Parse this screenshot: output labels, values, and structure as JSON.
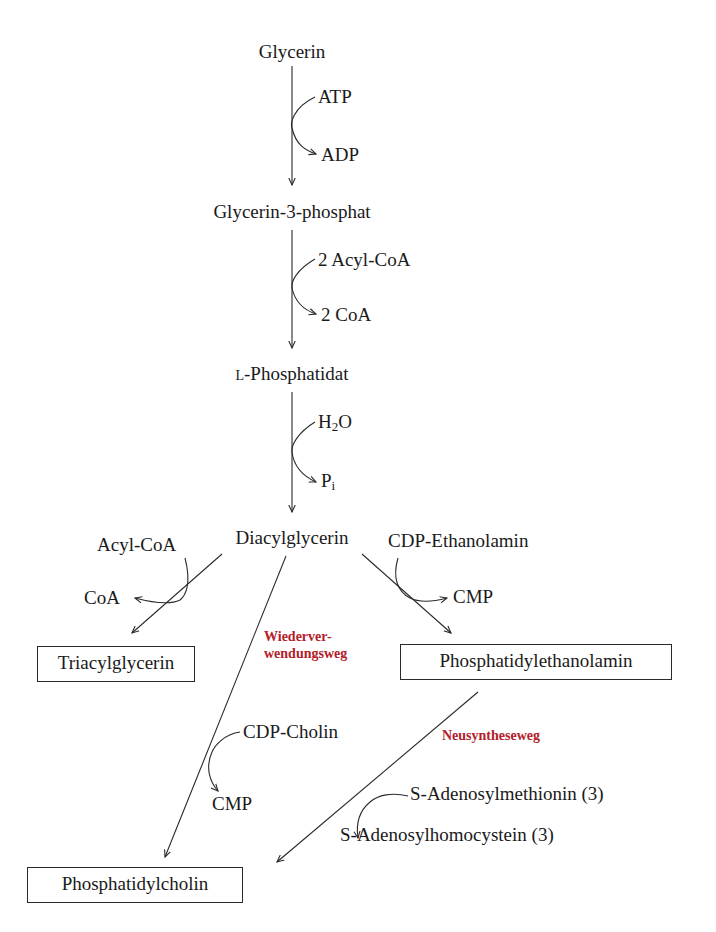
{
  "diagram": {
    "nodes": {
      "glycerin": "Glycerin",
      "glycerin3p": "Glycerin-3-phosphat",
      "phosphatidat_prefix": "L",
      "phosphatidat": "-Phosphatidat",
      "diacylglycerin": "Diacylglycerin",
      "triacylglycerin": "Triacylglycerin",
      "phosphatidylethanolamin": "Phosphatidylethanolamin",
      "phosphatidylcholin": "Phosphatidylcholin"
    },
    "cofactors": {
      "atp": "ATP",
      "adp": "ADP",
      "acylcoa2": "2 Acyl-CoA",
      "coa2": "2 CoA",
      "h2o_h": "H",
      "h2o_sub": "2",
      "h2o_o": "O",
      "pi_p": "P",
      "pi_sub": "i",
      "acylcoa": "Acyl-CoA",
      "coa": "CoA",
      "cdp_ethanolamin": "CDP-Ethanolamin",
      "cmp_right": "CMP",
      "cdp_cholin": "CDP-Cholin",
      "cmp_left": "CMP",
      "sam": "S-Adenosylmethionin (3)",
      "sah": "S-Adenosylhomocystein (3)"
    },
    "pathway_labels": {
      "salvage_line1": "Wiederver-",
      "salvage_line2": "wendungsweg",
      "denovo": "Neusyntheseweg"
    },
    "colors": {
      "pathway_label": "#b3202a",
      "line": "#2a2a2a",
      "text": "#1a1a1a"
    }
  }
}
